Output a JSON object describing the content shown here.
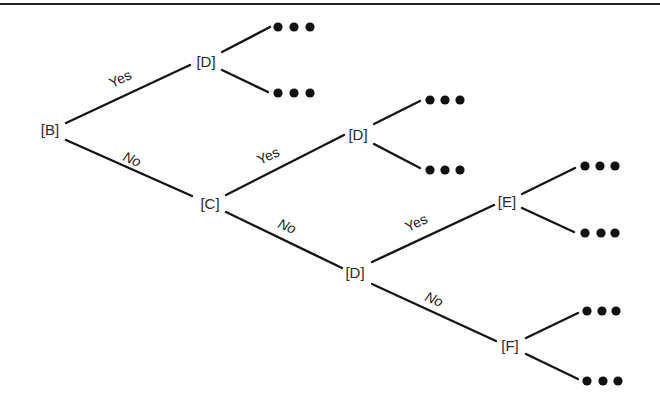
{
  "diagram": {
    "type": "decision-tree",
    "colors": {
      "line": "#141414",
      "text": "#2a2a2a",
      "background": "#ffffff"
    },
    "nodes": [
      {
        "id": "B",
        "label": "[B]",
        "x": 50,
        "y": 135
      },
      {
        "id": "D1",
        "label": "[D]",
        "x": 206,
        "y": 67
      },
      {
        "id": "C",
        "label": "[C]",
        "x": 210,
        "y": 209
      },
      {
        "id": "D2",
        "label": "[D]",
        "x": 358,
        "y": 140
      },
      {
        "id": "D3",
        "label": "[D]",
        "x": 355,
        "y": 278
      },
      {
        "id": "E",
        "label": "[E]",
        "x": 507,
        "y": 207
      },
      {
        "id": "F",
        "label": "[F]",
        "x": 510,
        "y": 351
      }
    ],
    "edges": [
      {
        "from": "B",
        "to": "D1",
        "label": "Yes",
        "x1": 66,
        "y1": 123,
        "x2": 190,
        "y2": 65,
        "lx": 112,
        "ly": 88,
        "angle": -25
      },
      {
        "from": "B",
        "to": "C",
        "label": "No",
        "x1": 66,
        "y1": 140,
        "x2": 192,
        "y2": 196,
        "lx": 122,
        "ly": 160,
        "angle": 24
      },
      {
        "from": "C",
        "to": "D2",
        "label": "Yes",
        "x1": 226,
        "y1": 195,
        "x2": 344,
        "y2": 135,
        "lx": 260,
        "ly": 165,
        "angle": -25
      },
      {
        "from": "C",
        "to": "D3",
        "label": "No",
        "x1": 226,
        "y1": 212,
        "x2": 342,
        "y2": 268,
        "lx": 277,
        "ly": 227,
        "angle": 24
      },
      {
        "from": "D3",
        "to": "E",
        "label": "Yes",
        "x1": 372,
        "y1": 262,
        "x2": 494,
        "y2": 205,
        "lx": 408,
        "ly": 232,
        "angle": -25
      },
      {
        "from": "D3",
        "to": "F",
        "label": "No",
        "x1": 372,
        "y1": 284,
        "x2": 496,
        "y2": 341,
        "lx": 424,
        "ly": 300,
        "angle": 24
      }
    ],
    "continuations": [
      {
        "from": "D1",
        "x1": 222,
        "y1": 52,
        "x2": 270,
        "y2": 27,
        "dots": [
          278,
          294,
          310
        ],
        "dy": 27
      },
      {
        "from": "D1",
        "x1": 222,
        "y1": 70,
        "x2": 268,
        "y2": 92,
        "dots": [
          278,
          294,
          310
        ],
        "dy": 93
      },
      {
        "from": "D2",
        "x1": 374,
        "y1": 124,
        "x2": 420,
        "y2": 101,
        "dots": [
          430,
          445,
          460
        ],
        "dy": 100
      },
      {
        "from": "D2",
        "x1": 374,
        "y1": 144,
        "x2": 420,
        "y2": 168,
        "dots": [
          430,
          445,
          460
        ],
        "dy": 170
      },
      {
        "from": "E",
        "x1": 522,
        "y1": 194,
        "x2": 575,
        "y2": 168,
        "dots": [
          585,
          600,
          615
        ],
        "dy": 166
      },
      {
        "from": "E",
        "x1": 522,
        "y1": 208,
        "x2": 574,
        "y2": 232,
        "dots": [
          585,
          601,
          615
        ],
        "dy": 233
      },
      {
        "from": "F",
        "x1": 526,
        "y1": 338,
        "x2": 578,
        "y2": 313,
        "dots": [
          587,
          602,
          616
        ],
        "dy": 311
      },
      {
        "from": "F",
        "x1": 526,
        "y1": 354,
        "x2": 578,
        "y2": 379,
        "dots": [
          587,
          603,
          618
        ],
        "dy": 381
      }
    ],
    "labels": {
      "B": "[B]",
      "D1": "[D]",
      "C": "[C]",
      "D2": "[D]",
      "D3": "[D]",
      "E": "[E]",
      "F": "[F]",
      "yes": "Yes",
      "no": "No",
      "ellipsis": "•••"
    }
  }
}
